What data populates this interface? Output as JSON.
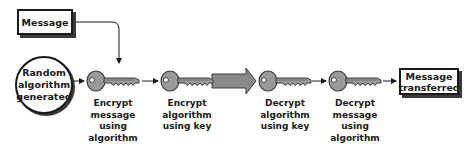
{
  "diagram": {
    "message_box": "Message",
    "random_circle": "Random\nalgorithm\ngenerated",
    "transferred_box": "Message\ntransferred",
    "steps": [
      {
        "icon": "key-icon",
        "caption": "Encrypt\nmessage\nusing\nalgorithm"
      },
      {
        "icon": "key-icon",
        "caption": "Encrypt\nalgorithm\nusing key"
      },
      {
        "icon": "key-icon",
        "caption": "Decrypt\nalgorithm\nusing key"
      },
      {
        "icon": "key-icon",
        "caption": "Decrypt\nmessage\nusing\nalgorithm"
      }
    ],
    "transfer_arrow": "large-arrow-right",
    "colors": {
      "line": "#1a1a1a",
      "key_fill": "#9a9a9a",
      "key_stroke": "#3a3a3a",
      "big_arrow_fill": "#8a8a8a"
    }
  }
}
